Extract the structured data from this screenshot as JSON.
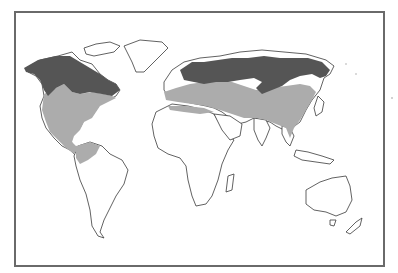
{
  "map": {
    "type": "world-outline-map",
    "legend": [],
    "regions": [
      {
        "name": "northern-band",
        "shade": "dark",
        "areas": [
          "Alaska",
          "Canada (southern half)",
          "Scandinavia",
          "Northern Russia / Siberia"
        ]
      },
      {
        "name": "temperate-band",
        "shade": "light",
        "areas": [
          "United States",
          "Mexico",
          "Central America",
          "Northern South America",
          "Europe",
          "North Africa coast",
          "Middle East",
          "Central Asia",
          "China",
          "Southeast Asia"
        ]
      }
    ],
    "colors": {
      "dark_shade": "#555555",
      "light_shade": "#acacac",
      "outline": "#3a3a3a",
      "frame": "#6a6a6a",
      "background": "#ffffff"
    }
  }
}
